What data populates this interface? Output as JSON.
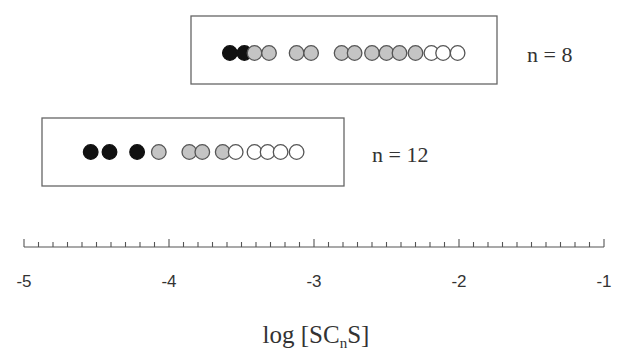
{
  "chart_data": {
    "type": "scatter",
    "title": "",
    "xlabel": "log [SCnS]",
    "xlabel_parts": {
      "pre": "log [SC",
      "sub": "n",
      "post": "S]"
    },
    "ylabel": "",
    "xlim": [
      -5,
      -1
    ],
    "x_ticks": [
      "-5",
      "-4",
      "-3",
      "-2",
      "-1"
    ],
    "minor_ticks_per_decade": 10,
    "grid": false,
    "legend": "none",
    "fill_legend": {
      "black": "filled",
      "gray": "partially filled",
      "white": "open"
    },
    "series": [
      {
        "name": "n = 8",
        "label": "n = 8",
        "points": [
          {
            "x": -3.58,
            "fill": "black"
          },
          {
            "x": -3.48,
            "fill": "black"
          },
          {
            "x": -3.41,
            "fill": "gray"
          },
          {
            "x": -3.31,
            "fill": "gray"
          },
          {
            "x": -3.12,
            "fill": "gray"
          },
          {
            "x": -3.02,
            "fill": "gray"
          },
          {
            "x": -2.81,
            "fill": "gray"
          },
          {
            "x": -2.72,
            "fill": "gray"
          },
          {
            "x": -2.6,
            "fill": "gray"
          },
          {
            "x": -2.5,
            "fill": "gray"
          },
          {
            "x": -2.41,
            "fill": "gray"
          },
          {
            "x": -2.3,
            "fill": "gray"
          },
          {
            "x": -2.19,
            "fill": "white"
          },
          {
            "x": -2.11,
            "fill": "white"
          },
          {
            "x": -2.01,
            "fill": "white"
          }
        ]
      },
      {
        "name": "n = 12",
        "label": "n = 12",
        "points": [
          {
            "x": -4.54,
            "fill": "black"
          },
          {
            "x": -4.41,
            "fill": "black"
          },
          {
            "x": -4.22,
            "fill": "black"
          },
          {
            "x": -4.07,
            "fill": "gray"
          },
          {
            "x": -3.86,
            "fill": "gray"
          },
          {
            "x": -3.77,
            "fill": "gray"
          },
          {
            "x": -3.63,
            "fill": "gray"
          },
          {
            "x": -3.54,
            "fill": "white"
          },
          {
            "x": -3.41,
            "fill": "white"
          },
          {
            "x": -3.32,
            "fill": "white"
          },
          {
            "x": -3.23,
            "fill": "white"
          },
          {
            "x": -3.12,
            "fill": "white"
          }
        ]
      }
    ]
  },
  "layout": {
    "axis": {
      "x0": 24,
      "px_per_unit": 145,
      "y": 247
    },
    "rows": [
      {
        "box": [
          191,
          16,
          306,
          68
        ],
        "cy": 53,
        "label_x": 527,
        "label_y": 62
      },
      {
        "box": [
          42,
          118,
          302,
          68
        ],
        "cy": 152,
        "label_x": 372,
        "label_y": 162
      }
    ],
    "radius": 7.3,
    "colors": {
      "black": "#111111",
      "gray": "#c4c4c4",
      "white": "#ffffff",
      "stroke": "#555555",
      "axis": "#555555"
    }
  }
}
